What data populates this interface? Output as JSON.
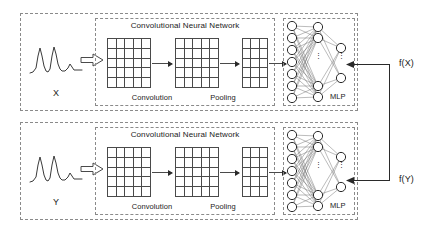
{
  "figure": {
    "type": "diagram",
    "branches": [
      {
        "id": "top",
        "input_label": "X",
        "output_label": "f(X)",
        "cnn_title": "Convolutional Neural Network",
        "stage_labels": [
          "Convolution",
          "Pooling"
        ],
        "mlp_label": "MLP",
        "feature_maps": [
          {
            "name": "conv-map-1",
            "cols": 5,
            "rows": 5
          },
          {
            "name": "conv-map-2",
            "cols": 5,
            "rows": 5
          },
          {
            "name": "pool-map",
            "cols": 3,
            "rows": 5
          }
        ],
        "mlp_layers": [
          {
            "name": "input-layer",
            "visible_nodes": 7,
            "has_ellipsis": false
          },
          {
            "name": "hidden-layer",
            "visible_nodes": 4,
            "has_ellipsis": true
          },
          {
            "name": "output-layer",
            "visible_nodes": 2,
            "has_ellipsis": true
          }
        ]
      },
      {
        "id": "bottom",
        "input_label": "Y",
        "output_label": "f(Y)",
        "cnn_title": "Convolutional Neural Network",
        "stage_labels": [
          "Convolution",
          "Pooling"
        ],
        "mlp_label": "MLP",
        "feature_maps": [
          {
            "name": "conv-map-1",
            "cols": 5,
            "rows": 5
          },
          {
            "name": "conv-map-2",
            "cols": 5,
            "rows": 5
          },
          {
            "name": "pool-map",
            "cols": 3,
            "rows": 5
          }
        ],
        "mlp_layers": [
          {
            "name": "input-layer",
            "visible_nodes": 7,
            "has_ellipsis": false
          },
          {
            "name": "hidden-layer",
            "visible_nodes": 4,
            "has_ellipsis": true
          },
          {
            "name": "output-layer",
            "visible_nodes": 2,
            "has_ellipsis": true
          }
        ]
      }
    ],
    "ellipsis_glyph": "⋮",
    "colors": {
      "background": "#ffffff",
      "dashed_border": "#8a8a8a",
      "grid_line": "#4a4a4a",
      "node_stroke": "#2a2a2a",
      "edge": "#6a6a6a",
      "text": "#1a1a1a",
      "wire": "#2a2a2a"
    }
  }
}
